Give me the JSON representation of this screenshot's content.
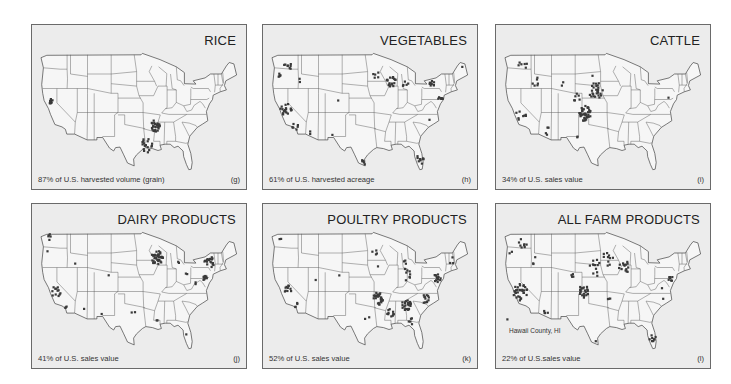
{
  "figure": {
    "panels": [
      {
        "id": "rice",
        "title": "RICE",
        "caption": "87% of U.S. harvested volume (grain)",
        "letter": "(g)",
        "note": "",
        "clusters": [
          {
            "region": "Sacramento Valley, CA",
            "lon": -121.8,
            "lat": 39.3,
            "count": 10,
            "spread": 0.5
          },
          {
            "region": "Arkansas/Mississippi Delta",
            "lon": -91.0,
            "lat": 34.2,
            "count": 28,
            "spread": 1.2
          },
          {
            "region": "Louisiana/Texas Gulf Coast",
            "lon": -93.6,
            "lat": 30.1,
            "count": 18,
            "spread": 1.5
          }
        ]
      },
      {
        "id": "vegetables",
        "title": "VEGETABLES",
        "caption": "61% of U.S. harvested acreage",
        "letter": "(h)",
        "note": "",
        "clusters": [
          {
            "region": "Washington",
            "lon": -120.0,
            "lat": 46.8,
            "count": 8,
            "spread": 1.2
          },
          {
            "region": "Oregon",
            "lon": -122.8,
            "lat": 45.0,
            "count": 5,
            "spread": 0.8
          },
          {
            "region": "Idaho",
            "lon": -116.5,
            "lat": 43.6,
            "count": 2,
            "spread": 0.6
          },
          {
            "region": "California Central Valley",
            "lon": -120.6,
            "lat": 37.5,
            "count": 18,
            "spread": 1.4
          },
          {
            "region": "Southern California",
            "lon": -117.8,
            "lat": 33.8,
            "count": 6,
            "spread": 1.0
          },
          {
            "region": "Arizona",
            "lon": -113.5,
            "lat": 32.8,
            "count": 2,
            "spread": 0.6
          },
          {
            "region": "Colorado",
            "lon": -105.0,
            "lat": 39.5,
            "count": 1,
            "spread": 0.2
          },
          {
            "region": "New Mexico",
            "lon": -106.8,
            "lat": 32.5,
            "count": 1,
            "spread": 0.2
          },
          {
            "region": "Minnesota",
            "lon": -94.0,
            "lat": 44.8,
            "count": 5,
            "spread": 0.8
          },
          {
            "region": "Wisconsin/Illinois",
            "lon": -89.5,
            "lat": 43.3,
            "count": 18,
            "spread": 1.2
          },
          {
            "region": "Michigan",
            "lon": -85.5,
            "lat": 43.0,
            "count": 5,
            "spread": 0.9
          },
          {
            "region": "New York",
            "lon": -77.5,
            "lat": 43.0,
            "count": 9,
            "spread": 0.7
          },
          {
            "region": "New Jersey/Delaware",
            "lon": -75.0,
            "lat": 39.8,
            "count": 8,
            "spread": 0.7
          },
          {
            "region": "Maine",
            "lon": -68.5,
            "lat": 46.5,
            "count": 1,
            "spread": 0.2
          },
          {
            "region": "North Carolina",
            "lon": -78.0,
            "lat": 35.5,
            "count": 1,
            "spread": 0.2
          },
          {
            "region": "South Texas",
            "lon": -98.0,
            "lat": 26.8,
            "count": 5,
            "spread": 0.8
          },
          {
            "region": "Florida",
            "lon": -81.0,
            "lat": 27.2,
            "count": 10,
            "spread": 1.0
          }
        ]
      },
      {
        "id": "cattle",
        "title": "CATTLE",
        "caption": "34% of U.S. sales value",
        "letter": "(i)",
        "note": "",
        "clusters": [
          {
            "region": "Washington",
            "lon": -119.5,
            "lat": 47.0,
            "count": 6,
            "spread": 1.2
          },
          {
            "region": "Idaho",
            "lon": -115.5,
            "lat": 43.5,
            "count": 6,
            "spread": 1.0
          },
          {
            "region": "Wyoming",
            "lon": -108.0,
            "lat": 43.0,
            "count": 2,
            "spread": 0.8
          },
          {
            "region": "South Dakota",
            "lon": -99.0,
            "lat": 44.5,
            "count": 1,
            "spread": 0.2
          },
          {
            "region": "California",
            "lon": -120.0,
            "lat": 36.5,
            "count": 8,
            "spread": 1.4
          },
          {
            "region": "Arizona",
            "lon": -112.5,
            "lat": 33.0,
            "count": 4,
            "spread": 1.0
          },
          {
            "region": "Nebraska",
            "lon": -98.0,
            "lat": 41.5,
            "count": 26,
            "spread": 1.8
          },
          {
            "region": "Colorado",
            "lon": -103.5,
            "lat": 40.2,
            "count": 6,
            "spread": 1.0
          },
          {
            "region": "Kansas/Oklahoma/Texas Panhandle",
            "lon": -101.2,
            "lat": 36.8,
            "count": 38,
            "spread": 1.6
          },
          {
            "region": "West Texas",
            "lon": -102.5,
            "lat": 32.0,
            "count": 2,
            "spread": 0.8
          },
          {
            "region": "Pennsylvania",
            "lon": -76.5,
            "lat": 40.0,
            "count": 1,
            "spread": 0.2
          }
        ]
      },
      {
        "id": "dairy",
        "title": "DAIRY PRODUCTS",
        "caption": "41% of U.S. sales value",
        "letter": "(j)",
        "note": "",
        "clusters": [
          {
            "region": "Washington",
            "lon": -122.0,
            "lat": 48.2,
            "count": 5,
            "spread": 0.7
          },
          {
            "region": "Oregon",
            "lon": -123.0,
            "lat": 45.3,
            "count": 1,
            "spread": 0.2
          },
          {
            "region": "Idaho",
            "lon": -114.5,
            "lat": 42.7,
            "count": 1,
            "spread": 0.2
          },
          {
            "region": "California Central Valley",
            "lon": -120.3,
            "lat": 37.0,
            "count": 12,
            "spread": 1.2
          },
          {
            "region": "Southern California",
            "lon": -117.5,
            "lat": 34.0,
            "count": 3,
            "spread": 0.5
          },
          {
            "region": "Arizona",
            "lon": -112.0,
            "lat": 33.4,
            "count": 1,
            "spread": 0.2
          },
          {
            "region": "Colorado",
            "lon": -104.8,
            "lat": 40.3,
            "count": 1,
            "spread": 0.2
          },
          {
            "region": "New Mexico",
            "lon": -106.7,
            "lat": 32.3,
            "count": 1,
            "spread": 0.2
          },
          {
            "region": "Texas",
            "lon": -97.5,
            "lat": 32.2,
            "count": 2,
            "spread": 1.0
          },
          {
            "region": "Minnesota/Wisconsin",
            "lon": -90.5,
            "lat": 44.0,
            "count": 40,
            "spread": 1.5
          },
          {
            "region": "Michigan",
            "lon": -84.5,
            "lat": 43.2,
            "count": 2,
            "spread": 0.6
          },
          {
            "region": "Ohio",
            "lon": -81.8,
            "lat": 40.8,
            "count": 2,
            "spread": 0.5
          },
          {
            "region": "New York/Vermont",
            "lon": -75.0,
            "lat": 43.0,
            "count": 18,
            "spread": 1.3
          },
          {
            "region": "Pennsylvania",
            "lon": -76.5,
            "lat": 40.2,
            "count": 10,
            "spread": 0.8
          },
          {
            "region": "Virginia",
            "lon": -79.0,
            "lat": 38.5,
            "count": 2,
            "spread": 0.4
          },
          {
            "region": "Louisiana",
            "lon": -90.5,
            "lat": 30.9,
            "count": 2,
            "spread": 0.3
          },
          {
            "region": "Florida",
            "lon": -82.0,
            "lat": 28.0,
            "count": 1,
            "spread": 0.2
          }
        ]
      },
      {
        "id": "poultry",
        "title": "POULTRY PRODUCTS",
        "caption": "52% of U.S. sales value",
        "letter": "(k)",
        "note": "",
        "clusters": [
          {
            "region": "Washington",
            "lon": -122.2,
            "lat": 47.8,
            "count": 2,
            "spread": 0.3
          },
          {
            "region": "California Central Valley",
            "lon": -120.5,
            "lat": 37.2,
            "count": 10,
            "spread": 1.2
          },
          {
            "region": "Southern California",
            "lon": -117.5,
            "lat": 34.2,
            "count": 4,
            "spread": 0.5
          },
          {
            "region": "Utah",
            "lon": -111.8,
            "lat": 39.5,
            "count": 1,
            "spread": 0.2
          },
          {
            "region": "Colorado",
            "lon": -104.8,
            "lat": 40.2,
            "count": 1,
            "spread": 0.2
          },
          {
            "region": "Minnesota",
            "lon": -94.5,
            "lat": 45.2,
            "count": 4,
            "spread": 0.7
          },
          {
            "region": "Iowa",
            "lon": -93.5,
            "lat": 42.3,
            "count": 1,
            "spread": 0.2
          },
          {
            "region": "Indiana/Ohio",
            "lon": -85.0,
            "lat": 40.5,
            "count": 8,
            "spread": 1.3
          },
          {
            "region": "Michigan",
            "lon": -85.5,
            "lat": 43.0,
            "count": 3,
            "spread": 0.7
          },
          {
            "region": "Pennsylvania/Delmarva",
            "lon": -76.0,
            "lat": 39.8,
            "count": 14,
            "spread": 0.9
          },
          {
            "region": "New England",
            "lon": -71.5,
            "lat": 43.5,
            "count": 3,
            "spread": 0.8
          },
          {
            "region": "Arkansas/Missouri",
            "lon": -93.5,
            "lat": 35.5,
            "count": 28,
            "spread": 1.3
          },
          {
            "region": "Mississippi",
            "lon": -89.8,
            "lat": 32.5,
            "count": 10,
            "spread": 1.0
          },
          {
            "region": "Alabama/Georgia",
            "lon": -85.0,
            "lat": 34.2,
            "count": 24,
            "spread": 1.2
          },
          {
            "region": "North Carolina",
            "lon": -79.5,
            "lat": 35.5,
            "count": 12,
            "spread": 1.0
          },
          {
            "region": "South Georgia/Florida",
            "lon": -83.5,
            "lat": 30.5,
            "count": 5,
            "spread": 1.0
          },
          {
            "region": "Texas",
            "lon": -96.5,
            "lat": 31.5,
            "count": 2,
            "spread": 0.8
          }
        ]
      },
      {
        "id": "all-farm",
        "title": "ALL FARM PRODUCTS",
        "caption": "22% of U.S.sales value",
        "letter": "(l)",
        "note": "Hawaii County, HI",
        "clusters": [
          {
            "region": "Washington",
            "lon": -119.5,
            "lat": 47.0,
            "count": 8,
            "spread": 1.0
          },
          {
            "region": "Oregon",
            "lon": -123.0,
            "lat": 45.0,
            "count": 2,
            "spread": 0.6
          },
          {
            "region": "Idaho",
            "lon": -115.5,
            "lat": 43.3,
            "count": 3,
            "spread": 0.9
          },
          {
            "region": "California",
            "lon": -120.2,
            "lat": 36.8,
            "count": 30,
            "spread": 1.8
          },
          {
            "region": "Arizona",
            "lon": -112.5,
            "lat": 33.0,
            "count": 4,
            "spread": 0.8
          },
          {
            "region": "Colorado",
            "lon": -104.5,
            "lat": 40.0,
            "count": 4,
            "spread": 0.7
          },
          {
            "region": "Nebraska/South Dakota",
            "lon": -98.0,
            "lat": 42.0,
            "count": 12,
            "spread": 1.8
          },
          {
            "region": "Minnesota/Iowa",
            "lon": -94.5,
            "lat": 43.8,
            "count": 10,
            "spread": 1.5
          },
          {
            "region": "Wisconsin/Illinois",
            "lon": -89.5,
            "lat": 42.0,
            "count": 14,
            "spread": 1.4
          },
          {
            "region": "Kansas/Oklahoma/Texas Panhandle",
            "lon": -101.5,
            "lat": 37.0,
            "count": 22,
            "spread": 1.3
          },
          {
            "region": "Arkansas",
            "lon": -94.0,
            "lat": 35.5,
            "count": 3,
            "spread": 0.3
          },
          {
            "region": "Pennsylvania/Delmarva",
            "lon": -76.0,
            "lat": 39.7,
            "count": 8,
            "spread": 0.7
          },
          {
            "region": "Virginia",
            "lon": -78.5,
            "lat": 37.5,
            "count": 1,
            "spread": 0.2
          },
          {
            "region": "North Carolina",
            "lon": -78.0,
            "lat": 35.5,
            "count": 1,
            "spread": 0.2
          },
          {
            "region": "Florida",
            "lon": -81.0,
            "lat": 27.0,
            "count": 8,
            "spread": 1.0
          },
          {
            "region": "South Texas",
            "lon": -97.8,
            "lat": 26.5,
            "count": 1,
            "spread": 0.2
          },
          {
            "region": "Hawaii County, HI (inset marker)",
            "lon": -124.0,
            "lat": 31.2,
            "count": 1,
            "spread": 0
          }
        ]
      }
    ]
  }
}
